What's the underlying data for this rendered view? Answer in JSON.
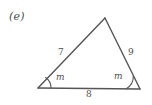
{
  "figure": {
    "part_label": "(e)",
    "shape": "triangle",
    "stroke_color": "#555555",
    "background_color": "#ffffff",
    "text_color": "#4f4f4f",
    "vertices": {
      "apex": {
        "x": 105,
        "y": 18
      },
      "bottom_left": {
        "x": 38,
        "y": 88
      },
      "bottom_right": {
        "x": 140,
        "y": 89
      }
    },
    "sides": {
      "left_label": "7",
      "right_label": "9",
      "base_label": "8"
    },
    "angles": {
      "left_label": "m",
      "right_label": "m",
      "left_arc_radius": 13,
      "right_arc_radius": 14
    }
  }
}
